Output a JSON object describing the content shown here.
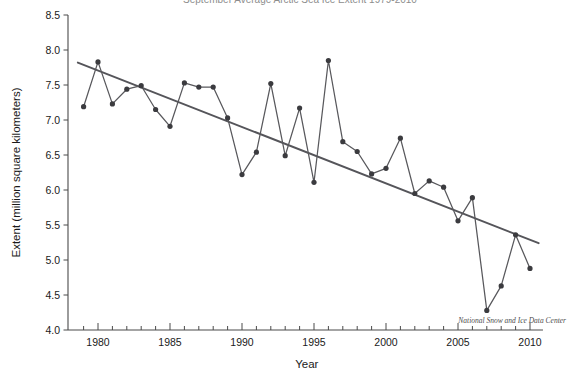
{
  "chart_data": {
    "type": "line",
    "title": "September Average Arctic Sea Ice Extent 1979-2010",
    "xlabel": "Year",
    "ylabel": "Extent (million square kilometers)",
    "xlim": [
      1978.4,
      2010.9
    ],
    "ylim": [
      4.0,
      8.5
    ],
    "grid": false,
    "legend": null,
    "credit": "National Snow and Ice Data Center",
    "x_major_ticks": [
      1980,
      1985,
      1990,
      1995,
      2000,
      2005,
      2010
    ],
    "x_major_tick_labels": [
      "1980",
      "1985",
      "1990",
      "1995",
      "2000",
      "2005",
      "2010"
    ],
    "x_minor_tick_step": 1,
    "y_ticks": [
      4.0,
      4.5,
      5.0,
      5.5,
      6.0,
      6.5,
      7.0,
      7.5,
      8.0,
      8.5
    ],
    "y_tick_labels": [
      "4.0",
      "4.5",
      "5.0",
      "5.5",
      "6.0",
      "6.5",
      "7.0",
      "7.5",
      "8.0",
      "8.5"
    ],
    "series": [
      {
        "name": "September sea ice extent",
        "marker": "circle",
        "color": "#3b3b3f",
        "x": [
          1979,
          1980,
          1981,
          1982,
          1983,
          1984,
          1985,
          1986,
          1987,
          1988,
          1989,
          1990,
          1991,
          1992,
          1993,
          1994,
          1995,
          1996,
          1997,
          1998,
          1999,
          2000,
          2001,
          2002,
          2003,
          2004,
          2005,
          2006,
          2007,
          2008,
          2009,
          2010
        ],
        "values": [
          7.19,
          7.83,
          7.23,
          7.44,
          7.49,
          7.15,
          6.91,
          7.53,
          7.47,
          7.47,
          7.03,
          6.22,
          6.54,
          7.52,
          6.49,
          7.17,
          6.11,
          7.85,
          6.69,
          6.55,
          6.23,
          6.31,
          6.74,
          5.95,
          6.13,
          6.04,
          5.56,
          5.89,
          4.28,
          4.63,
          5.36,
          4.88
        ]
      }
    ],
    "trend": {
      "name": "linear trend",
      "color": "#55555a",
      "x": [
        1978.6,
        2010.6
      ],
      "values": [
        7.82,
        5.24
      ]
    }
  }
}
